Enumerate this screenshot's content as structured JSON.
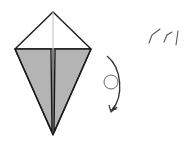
{
  "diagram": {
    "type": "origami-step",
    "description": "Kite base with both lower flaps folded to the center (shaded), followed by a turn-over instruction",
    "colors": {
      "background": "#ffffff",
      "outline": "#1a1a1a",
      "paper_front": "#ffffff",
      "paper_back": "#b4b4b4",
      "center_crease": "#bcbcbc",
      "arrow": "#333333",
      "marks": "#555555"
    },
    "kite": {
      "top": [
        53,
        12
      ],
      "left": [
        15,
        49
      ],
      "right": [
        91,
        49
      ],
      "bottom": [
        53,
        135
      ]
    },
    "flaps": [
      {
        "name": "left-flap",
        "points": [
          [
            15,
            49
          ],
          [
            51,
            49
          ],
          [
            52,
            132
          ]
        ]
      },
      {
        "name": "right-flap",
        "points": [
          [
            55,
            49
          ],
          [
            91,
            49
          ],
          [
            54,
            132
          ]
        ]
      }
    ],
    "turn_over_symbol": {
      "label": "Turn over",
      "arrow_start": [
        107,
        56
      ],
      "arrow_end": [
        112,
        111
      ],
      "circle_center": [
        111,
        82
      ],
      "circle_radius": 7
    },
    "marks_text": "ノノ|"
  }
}
